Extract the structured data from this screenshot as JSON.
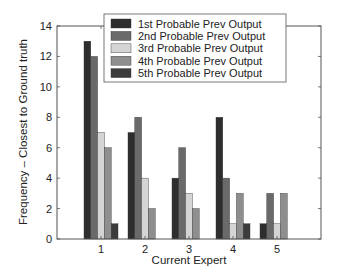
{
  "chart_data": {
    "type": "bar",
    "title": "",
    "xlabel": "Current Expert",
    "ylabel": "Frequency – Closest to Ground truth",
    "categories": [
      "1",
      "2",
      "3",
      "4",
      "5"
    ],
    "series": [
      {
        "name": "1st Probable Prev Output",
        "color": "#2e2e2e",
        "values": [
          13,
          7,
          4,
          8,
          1
        ]
      },
      {
        "name": "2nd Probable Prev Output",
        "color": "#6a6a6a",
        "values": [
          12,
          8,
          6,
          4,
          3
        ]
      },
      {
        "name": "3rd Probable Prev Output",
        "color": "#d4d4d4",
        "values": [
          7,
          4,
          3,
          1,
          1
        ]
      },
      {
        "name": "4th Probable Prev Output",
        "color": "#8e8e8e",
        "values": [
          6,
          2,
          2,
          3,
          3
        ]
      },
      {
        "name": "5th Probable Prev Output",
        "color": "#3c3c3c",
        "values": [
          1,
          0,
          0,
          1,
          0
        ]
      }
    ],
    "xlim": [
      0,
      6
    ],
    "ylim": [
      0,
      14
    ],
    "yticks": [
      0,
      2,
      4,
      6,
      8,
      10,
      12,
      14
    ],
    "xticks": [
      1,
      2,
      3,
      4,
      5
    ],
    "grid": false,
    "legend_position": "upper center"
  }
}
